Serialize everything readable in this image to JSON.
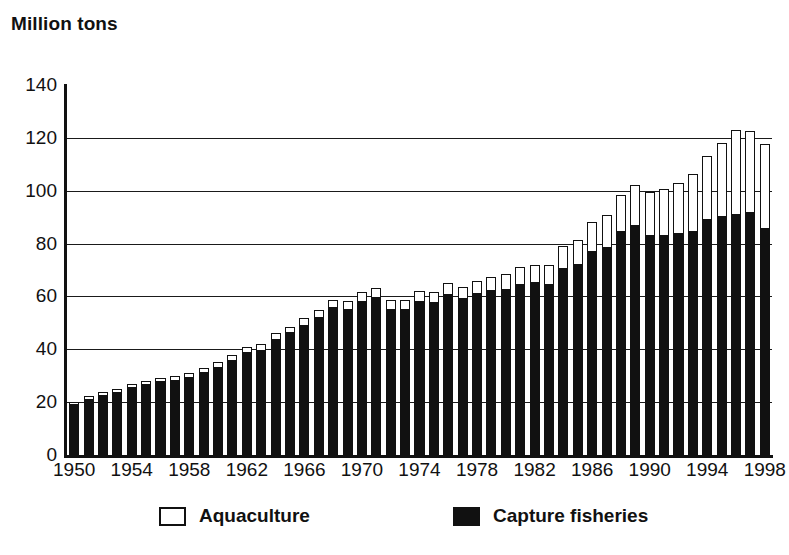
{
  "chart_data": {
    "type": "bar",
    "stacked": true,
    "title": "Million tons",
    "xlabel": "",
    "ylabel": "Million tons",
    "ylim": [
      0,
      140
    ],
    "ytick_step": 20,
    "yticks": [
      140,
      120,
      100,
      80,
      60,
      40,
      20,
      0
    ],
    "grid": "horizontal",
    "gridline_values": [
      120,
      100,
      80,
      60,
      40,
      20
    ],
    "legend_position": "bottom",
    "categories": [
      1950,
      1951,
      1952,
      1953,
      1954,
      1955,
      1956,
      1957,
      1958,
      1959,
      1960,
      1961,
      1962,
      1963,
      1964,
      1965,
      1966,
      1967,
      1968,
      1969,
      1970,
      1971,
      1972,
      1973,
      1974,
      1975,
      1976,
      1977,
      1978,
      1979,
      1980,
      1981,
      1982,
      1983,
      1984,
      1985,
      1986,
      1987,
      1988,
      1989,
      1990,
      1991,
      1992,
      1993,
      1994,
      1995,
      1996,
      1997,
      1998
    ],
    "xtick_labels": [
      "1950",
      "1954",
      "1958",
      "1962",
      "1966",
      "1970",
      "1974",
      "1978",
      "1982",
      "1986",
      "1990",
      "1994",
      "1998"
    ],
    "xtick_years": [
      1950,
      1954,
      1958,
      1962,
      1966,
      1970,
      1974,
      1978,
      1982,
      1986,
      1990,
      1994,
      1998
    ],
    "series": [
      {
        "name": "Capture fisheries",
        "color": "#111111",
        "values": [
          19.0,
          21.0,
          22.5,
          23.5,
          25.5,
          26.5,
          27.5,
          28.0,
          29.0,
          31.0,
          33.0,
          35.5,
          38.5,
          39.5,
          43.5,
          46.0,
          49.0,
          52.0,
          55.5,
          55.0,
          58.0,
          59.5,
          55.0,
          55.0,
          58.0,
          57.5,
          60.5,
          59.0,
          61.0,
          62.0,
          62.5,
          64.5,
          65.0,
          64.5,
          70.5,
          72.0,
          77.0,
          78.5,
          84.5,
          86.5,
          83.0,
          83.0,
          83.5,
          84.5,
          89.0,
          90.0,
          91.0,
          91.5,
          85.5
        ]
      },
      {
        "name": "Aquaculture",
        "color": "#ffffff",
        "values": [
          1.0,
          1.2,
          1.3,
          1.4,
          1.5,
          1.6,
          1.7,
          1.8,
          1.9,
          2.0,
          2.1,
          2.2,
          2.3,
          2.4,
          2.5,
          2.6,
          2.8,
          3.0,
          3.2,
          3.4,
          3.5,
          3.6,
          3.7,
          3.8,
          4.0,
          4.3,
          4.5,
          4.7,
          5.0,
          5.5,
          6.0,
          6.5,
          7.0,
          7.5,
          8.5,
          9.5,
          11.0,
          12.5,
          14.0,
          15.5,
          16.5,
          17.5,
          19.5,
          22.0,
          24.0,
          28.0,
          32.0,
          31.0,
          32.0
        ]
      }
    ],
    "totals": [
      20.0,
      22.2,
      23.8,
      24.9,
      27.0,
      28.1,
      29.2,
      29.8,
      30.9,
      33.0,
      35.1,
      37.7,
      40.8,
      41.9,
      46.0,
      48.6,
      51.8,
      55.0,
      58.7,
      58.4,
      61.5,
      63.1,
      58.7,
      58.8,
      62.0,
      61.8,
      65.0,
      63.7,
      66.0,
      67.5,
      68.5,
      71.0,
      72.0,
      72.0,
      79.0,
      81.5,
      88.0,
      91.0,
      98.5,
      102.0,
      99.5,
      100.5,
      103.0,
      106.5,
      113.0,
      118.0,
      123.0,
      122.5,
      117.5
    ]
  },
  "legend": {
    "items": [
      {
        "label": "Aquaculture",
        "style": "hollow"
      },
      {
        "label": "Capture fisheries",
        "style": "filled"
      }
    ]
  }
}
